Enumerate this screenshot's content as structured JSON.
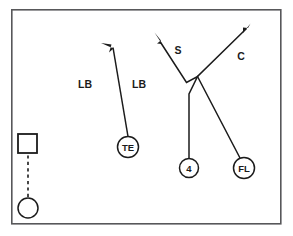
{
  "diagram": {
    "type": "american-football-play-schematic",
    "field": {
      "border_color": "#58585a",
      "background_color": "#ffffff",
      "x": 11,
      "y": 9,
      "width": 270,
      "height": 215
    },
    "ink_color": "#1b1b1b",
    "players": [
      {
        "id": "offensive-lineman",
        "label": "",
        "shape": "square",
        "x": 27.5,
        "y": 143.5,
        "size": 19
      },
      {
        "id": "motion-back",
        "label": "",
        "shape": "circle",
        "x": 28,
        "y": 208,
        "radius": 10
      },
      {
        "id": "tight-end",
        "label": "TE",
        "shape": "circle",
        "x": 128,
        "y": 147,
        "radius": 10.5
      },
      {
        "id": "back-four",
        "label": "4",
        "shape": "circle",
        "x": 189,
        "y": 168,
        "radius": 9.5
      },
      {
        "id": "flanker",
        "label": "FL",
        "shape": "circle",
        "x": 244,
        "y": 168,
        "radius": 10.5
      }
    ],
    "zone_labels": [
      {
        "id": "linebacker-left",
        "text": "LB",
        "x": 85,
        "y": 84
      },
      {
        "id": "linebacker-right",
        "text": "LB",
        "x": 139,
        "y": 84
      }
    ],
    "route_labels": [
      {
        "id": "safety-route",
        "text": "S",
        "x": 178,
        "y": 50
      },
      {
        "id": "corner-route",
        "text": "C",
        "x": 241,
        "y": 56
      }
    ],
    "routes": [
      {
        "id": "tight-end-route",
        "player": "TE",
        "description": "vertical seam breaking up-left",
        "points": [
          [
            128,
            136.5
          ],
          [
            113,
            48
          ]
        ],
        "arrow_tip": [
          101,
          43
        ],
        "arrow_from": [
          113,
          48
        ]
      },
      {
        "id": "back-four-route",
        "player": "4",
        "description": "stem up then break out and deep up-left past safety",
        "points": [
          [
            189,
            158.5
          ],
          [
            189,
            94
          ],
          [
            197,
            76
          ],
          [
            186,
            82
          ],
          [
            159,
            41
          ]
        ],
        "arrow_tip": [
          155,
          33
        ],
        "arrow_from": [
          160,
          42
        ]
      },
      {
        "id": "flanker-route",
        "player": "FL",
        "description": "corner route breaking up-right",
        "points": [
          [
            240,
            158
          ],
          [
            197,
            76
          ],
          [
            247,
            28
          ]
        ],
        "arrow_tip": [
          250,
          24
        ],
        "arrow_from": [
          243,
          32
        ]
      }
    ],
    "motion": {
      "id": "motion-path",
      "description": "dashed motion line from back to lineman alignment",
      "from": [
        28,
        198
      ],
      "to": [
        28,
        154
      ],
      "style": "dashed"
    }
  }
}
